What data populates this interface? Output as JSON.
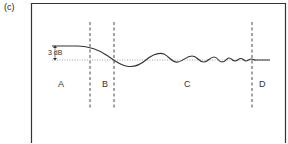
{
  "figure": {
    "panel_label": "(c)",
    "annotation": "3 dB",
    "regions": [
      {
        "label": "A"
      },
      {
        "label": "B"
      },
      {
        "label": "C"
      },
      {
        "label": "D"
      }
    ]
  },
  "colors": {
    "frame": "#333333",
    "curve": "#333333",
    "reference_line": "#777777",
    "dashed_dividers": "#333333"
  }
}
